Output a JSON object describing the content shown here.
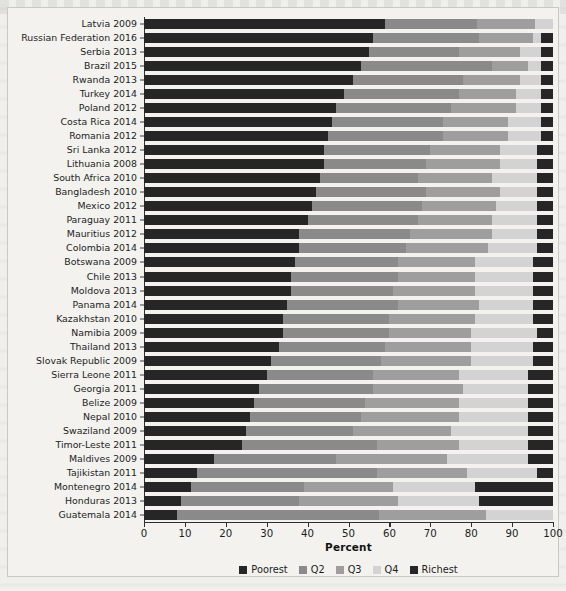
{
  "chart_data": {
    "type": "bar",
    "subtype": "stacked-horizontal-100",
    "title": "",
    "xlabel": "Percent",
    "ylabel": "",
    "xlim": [
      0,
      100
    ],
    "xticks": [
      0,
      10,
      20,
      30,
      40,
      50,
      60,
      70,
      80,
      90,
      100
    ],
    "xtick_labels": [
      "0",
      "10",
      "20",
      "30",
      "40",
      "50",
      "60",
      "70",
      "80",
      "90",
      "100"
    ],
    "grid": false,
    "legend_position": "bottom-center",
    "legend": [
      "Poorest",
      "Q2",
      "Q3",
      "Q4",
      "Richest"
    ],
    "series": [
      {
        "name": "Poorest",
        "color": "#262626"
      },
      {
        "name": "Q2",
        "color": "#8a8a8a"
      },
      {
        "name": "Q3",
        "color": "#9e9e9e"
      },
      {
        "name": "Q4",
        "color": "#d3d3d3"
      },
      {
        "name": "Richest",
        "color": "#262626"
      }
    ],
    "categories": [
      "Latvia 2009",
      "Russian Federation 2016",
      "Serbia 2013",
      "Brazil 2015",
      "Rwanda 2013",
      "Turkey 2014",
      "Poland 2012",
      "Costa Rica 2014",
      "Romania 2012",
      "Sri Lanka 2012",
      "Lithuania 2008",
      "South Africa 2010",
      "Bangladesh 2010",
      "Mexico 2012",
      "Paraguay 2011",
      "Mauritius 2012",
      "Colombia 2014",
      "Botswana 2009",
      "Chile 2013",
      "Moldova 2013",
      "Panama 2014",
      "Kazakhstan 2010",
      "Namibia 2009",
      "Thailand 2013",
      "Slovak Republic 2009",
      "Sierra Leone 2011",
      "Georgia 2011",
      "Belize 2009",
      "Nepal 2010",
      "Swaziland 2009",
      "Timor-Leste 2011",
      "Maldives 2009",
      "Tajikistan 2011",
      "Montenegro 2014",
      "Honduras 2013",
      "Guatemala 2014"
    ],
    "values": [
      [
        59.0,
        22.5,
        14.0,
        4.5,
        0.0
      ],
      [
        56.0,
        26.0,
        13.0,
        2.0,
        3.0
      ],
      [
        55.0,
        22.0,
        15.0,
        5.0,
        3.0
      ],
      [
        53.0,
        32.0,
        9.0,
        3.0,
        3.0
      ],
      [
        51.0,
        27.0,
        14.0,
        5.0,
        3.0
      ],
      [
        49.0,
        28.0,
        14.0,
        6.0,
        3.0
      ],
      [
        47.0,
        28.0,
        16.0,
        6.0,
        3.0
      ],
      [
        46.0,
        27.0,
        16.0,
        8.0,
        3.0
      ],
      [
        45.0,
        28.0,
        16.0,
        8.0,
        3.0
      ],
      [
        44.0,
        26.0,
        17.0,
        9.0,
        4.0
      ],
      [
        44.0,
        25.0,
        18.0,
        9.0,
        4.0
      ],
      [
        43.0,
        24.0,
        18.0,
        11.0,
        4.0
      ],
      [
        42.0,
        27.0,
        18.0,
        9.0,
        4.0
      ],
      [
        41.0,
        27.0,
        18.0,
        10.0,
        4.0
      ],
      [
        40.0,
        27.0,
        18.0,
        11.0,
        4.0
      ],
      [
        38.0,
        27.0,
        20.0,
        11.0,
        4.0
      ],
      [
        38.0,
        26.0,
        20.0,
        12.0,
        4.0
      ],
      [
        37.0,
        25.0,
        19.0,
        14.0,
        5.0
      ],
      [
        36.0,
        26.0,
        19.0,
        14.0,
        5.0
      ],
      [
        36.0,
        25.0,
        20.0,
        14.0,
        5.0
      ],
      [
        35.0,
        27.0,
        20.0,
        13.0,
        5.0
      ],
      [
        34.0,
        26.0,
        21.0,
        14.0,
        5.0
      ],
      [
        34.0,
        26.0,
        20.0,
        16.0,
        4.0
      ],
      [
        33.0,
        26.0,
        21.0,
        15.0,
        5.0
      ],
      [
        31.0,
        27.0,
        22.0,
        15.0,
        5.0
      ],
      [
        30.0,
        26.0,
        21.0,
        17.0,
        6.0
      ],
      [
        28.0,
        28.0,
        22.0,
        16.0,
        6.0
      ],
      [
        27.0,
        27.0,
        23.0,
        17.0,
        6.0
      ],
      [
        26.0,
        27.0,
        24.0,
        17.0,
        6.0
      ],
      [
        25.0,
        26.0,
        24.0,
        19.0,
        6.0
      ],
      [
        24.0,
        33.0,
        20.0,
        17.0,
        6.0
      ],
      [
        17.0,
        30.0,
        27.0,
        20.0,
        6.0
      ],
      [
        13.0,
        44.0,
        22.0,
        17.0,
        4.0
      ],
      [
        11.5,
        27.5,
        22.0,
        20.0,
        19.0
      ],
      [
        9.0,
        29.0,
        24.0,
        20.0,
        18.0
      ],
      [
        8.0,
        49.5,
        26.0,
        16.5,
        0.0
      ]
    ]
  }
}
